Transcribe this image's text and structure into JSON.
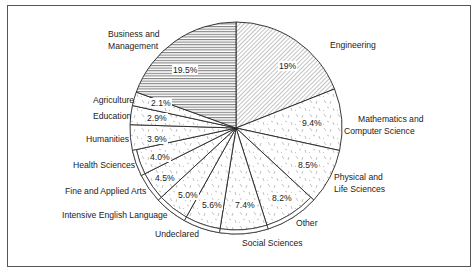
{
  "title_partial": "...egree-seeking students by field of study, ...",
  "chart_data": {
    "type": "pie",
    "title": "",
    "start_angle_deg": 0,
    "direction": "clockwise",
    "slices": [
      {
        "label": "Engineering",
        "value": 19.0,
        "display": "19%",
        "pattern": "diagonal-hatch"
      },
      {
        "label": "Mathematics and Computer Science",
        "value": 9.4,
        "display": "9.4%",
        "pattern": "dash-stipple"
      },
      {
        "label": "Physical and Life Sciences",
        "value": 8.5,
        "display": "8.5%",
        "pattern": "dash-stipple"
      },
      {
        "label": "Other",
        "value": 8.2,
        "display": "8.2%",
        "pattern": "dash-stipple"
      },
      {
        "label": "Social Sciences",
        "value": 7.4,
        "display": "7.4%",
        "pattern": "dash-stipple"
      },
      {
        "label": "Undeclared",
        "value": 5.6,
        "display": "5.6%",
        "pattern": "dash-stipple"
      },
      {
        "label": "Intensive English Language",
        "value": 5.0,
        "display": "5.0%",
        "pattern": "dash-stipple"
      },
      {
        "label": "Fine and Applied Arts",
        "value": 4.5,
        "display": "4.5%",
        "pattern": "dash-stipple"
      },
      {
        "label": "Health Sciences",
        "value": 4.0,
        "display": "4.0%",
        "pattern": "dash-stipple"
      },
      {
        "label": "Humanities",
        "value": 3.9,
        "display": "3.9%",
        "pattern": "dash-stipple"
      },
      {
        "label": "Education",
        "value": 2.9,
        "display": "2.9%",
        "pattern": "dash-stipple"
      },
      {
        "label": "Agriculture",
        "value": 2.1,
        "display": "2.1%",
        "pattern": "dash-stipple"
      },
      {
        "label": "Business and Management",
        "value": 19.5,
        "display": "19.5%",
        "pattern": "horizontal-lines"
      }
    ],
    "categories": [
      "Engineering",
      "Mathematics and Computer Science",
      "Physical and Life Sciences",
      "Other",
      "Social Sciences",
      "Undeclared",
      "Intensive English Language",
      "Fine and Applied Arts",
      "Health Sciences",
      "Humanities",
      "Education",
      "Agriculture",
      "Business and Management"
    ],
    "values": [
      19.0,
      9.4,
      8.5,
      8.2,
      7.4,
      5.6,
      5.0,
      4.5,
      4.0,
      3.9,
      2.9,
      2.1,
      19.5
    ],
    "unit": "%",
    "legend": "none (direct labels)"
  },
  "labels": {
    "engineering": "Engineering",
    "math_1": "Mathematics and",
    "math_2": "Computer Science",
    "phys_1": "Physical and",
    "phys_2": "Life Sciences",
    "other": "Other",
    "social": "Social Sciences",
    "undeclared": "Undeclared",
    "english": "Intensive English Language",
    "arts": "Fine and Applied Arts",
    "health": "Health Sciences",
    "humanities": "Humanities",
    "education": "Education",
    "agriculture": "Agriculture",
    "business_1": "Business and",
    "business_2": "Management"
  },
  "pcts": {
    "engineering": "19%",
    "math": "9.4%",
    "phys": "8.5%",
    "other": "8.2%",
    "social": "7.4%",
    "undeclared": "5.6%",
    "english": "5.0%",
    "arts": "4.5%",
    "health": "4.0%",
    "humanities": "3.9%",
    "education": "2.9%",
    "agriculture": "2.1%",
    "business": "19.5%"
  }
}
